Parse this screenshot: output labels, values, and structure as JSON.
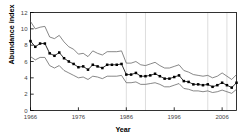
{
  "chart_data": {
    "type": "line",
    "title": "",
    "xlabel": "Year",
    "ylabel": "Abundance index",
    "xlim": [
      1966,
      2009
    ],
    "ylim": [
      0,
      12
    ],
    "yticks": [
      0,
      2,
      4,
      6,
      8,
      10,
      12
    ],
    "xticks": [
      1966,
      1976,
      1986,
      1996,
      2006
    ],
    "grid": "vertical-light",
    "legend": "none",
    "x": [
      1966,
      1967,
      1968,
      1969,
      1970,
      1971,
      1972,
      1973,
      1974,
      1975,
      1976,
      1977,
      1978,
      1979,
      1980,
      1981,
      1982,
      1983,
      1984,
      1985,
      1986,
      1987,
      1988,
      1989,
      1990,
      1991,
      1992,
      1993,
      1994,
      1995,
      1996,
      1997,
      1998,
      1999,
      2000,
      2001,
      2002,
      2003,
      2004,
      2005,
      2006,
      2007,
      2008,
      2009
    ],
    "series": [
      {
        "name": "Upper confidence limit",
        "style": "thin-line-no-marker",
        "values": [
          10.9,
          10.0,
          10.2,
          10.3,
          9.0,
          8.8,
          9.2,
          8.4,
          7.8,
          7.5,
          6.9,
          7.0,
          6.6,
          7.3,
          7.0,
          6.8,
          7.2,
          7.2,
          7.2,
          7.3,
          5.8,
          5.8,
          6.0,
          5.6,
          5.5,
          5.7,
          5.9,
          5.5,
          5.2,
          5.2,
          5.4,
          5.6,
          4.9,
          4.7,
          4.4,
          4.3,
          4.2,
          4.3,
          4.0,
          4.2,
          4.6,
          4.2,
          3.8,
          4.4
        ]
      },
      {
        "name": "Abundance index",
        "style": "line-with-square-markers",
        "values": [
          8.5,
          7.8,
          8.2,
          8.2,
          7.0,
          6.7,
          7.1,
          6.4,
          6.0,
          5.7,
          5.3,
          5.4,
          5.0,
          5.6,
          5.4,
          5.2,
          5.6,
          5.6,
          5.6,
          5.7,
          4.4,
          4.4,
          4.6,
          4.2,
          4.2,
          4.3,
          4.5,
          4.2,
          3.9,
          3.9,
          4.1,
          4.3,
          3.6,
          3.5,
          3.2,
          3.2,
          3.1,
          3.2,
          2.9,
          3.1,
          3.4,
          3.1,
          2.8,
          3.4
        ]
      },
      {
        "name": "Lower confidence limit",
        "style": "thin-line-no-marker",
        "values": [
          6.6,
          6.2,
          6.5,
          6.5,
          5.5,
          5.2,
          5.5,
          4.9,
          4.6,
          4.3,
          4.0,
          4.1,
          3.8,
          4.2,
          4.1,
          3.9,
          4.2,
          4.2,
          4.2,
          4.3,
          3.4,
          3.4,
          3.5,
          3.2,
          3.2,
          3.3,
          3.4,
          3.2,
          2.9,
          2.9,
          3.1,
          3.3,
          2.7,
          2.6,
          2.4,
          2.4,
          2.3,
          2.4,
          2.2,
          2.3,
          2.5,
          2.3,
          2.1,
          2.6
        ]
      }
    ],
    "vertical_gridlines": [
      1986,
      1990,
      2003,
      2007
    ]
  },
  "axes": {
    "y_title": "Abundance index",
    "x_title": "Year",
    "ytick_labels": [
      "0",
      "2",
      "4",
      "6",
      "8",
      "10",
      "12"
    ],
    "xtick_labels": [
      "1966",
      "1976",
      "1986",
      "1996",
      "2006"
    ]
  },
  "colors": {
    "line": "#000000",
    "band": "#555555",
    "axis": "#000000",
    "grid": "#d9d9d9",
    "background": "#ffffff"
  }
}
